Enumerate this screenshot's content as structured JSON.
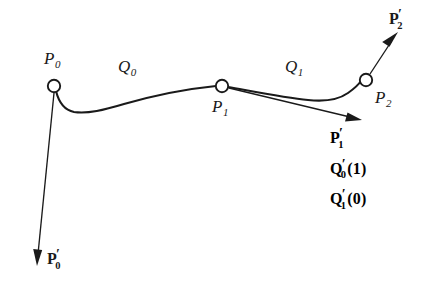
{
  "figure": {
    "type": "spline-continuity-diagram",
    "background_color": "#ffffff",
    "ink_color": "#1a1a1a"
  },
  "control_points": [
    {
      "id": "p0",
      "label": "P",
      "subscript": "0",
      "x": 54,
      "y": 86
    },
    {
      "id": "p1",
      "label": "P",
      "subscript": "1",
      "x": 222,
      "y": 86
    },
    {
      "id": "p2",
      "label": "P",
      "subscript": "2",
      "x": 366,
      "y": 80
    }
  ],
  "segments": [
    {
      "id": "q0",
      "label": "Q",
      "subscript": "0",
      "from": "p0",
      "to": "p1"
    },
    {
      "id": "q1",
      "label": "Q",
      "subscript": "1",
      "from": "p1",
      "to": "p2"
    }
  ],
  "tangent_vectors": [
    {
      "id": "p0prime",
      "label": "P",
      "prime": "′",
      "subscript": "0",
      "at": "p0",
      "direction": "down"
    },
    {
      "id": "p1prime",
      "label": "P",
      "prime": "′",
      "subscript": "1",
      "at": "p1",
      "direction": "right-down"
    },
    {
      "id": "p2prime",
      "label": "P",
      "prime": "′",
      "subscript": "2",
      "at": "p2",
      "direction": "up-right"
    }
  ],
  "derivative_block": [
    {
      "id": "p1prime-text",
      "base": "P",
      "prime": "′",
      "subscript": "1",
      "argument": ""
    },
    {
      "id": "q0prime-1",
      "base": "Q",
      "prime": "′",
      "subscript": "0",
      "argument": "(1)"
    },
    {
      "id": "q1prime-0",
      "base": "Q",
      "prime": "′",
      "subscript": "1",
      "argument": "(0)"
    }
  ],
  "labels": {
    "p0": "P",
    "p0_sub": "0",
    "p1": "P",
    "p1_sub": "1",
    "p2": "P",
    "p2_sub": "2",
    "q0": "Q",
    "q0_sub": "0",
    "q1": "Q",
    "q1_sub": "1",
    "prime": "′",
    "arg_one": "(1)",
    "arg_zero": "(0)"
  }
}
